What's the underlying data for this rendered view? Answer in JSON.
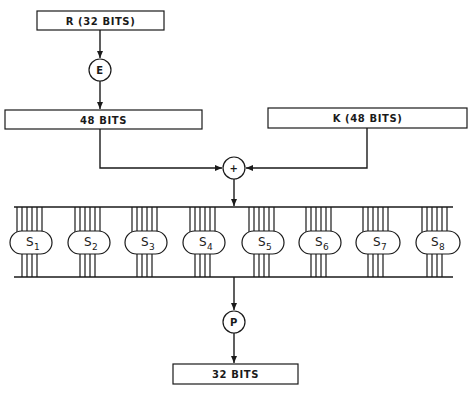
{
  "diagram": {
    "input_box": {
      "label": "R (32 BITS)"
    },
    "expansion": {
      "label": "E"
    },
    "expanded_box": {
      "label": "48 BITS"
    },
    "key_box": {
      "label": "K (48 BITS)"
    },
    "xor": {
      "label": "+"
    },
    "sboxes": [
      {
        "label": "S",
        "sub": "1"
      },
      {
        "label": "S",
        "sub": "2"
      },
      {
        "label": "S",
        "sub": "3"
      },
      {
        "label": "S",
        "sub": "4"
      },
      {
        "label": "S",
        "sub": "5"
      },
      {
        "label": "S",
        "sub": "6"
      },
      {
        "label": "S",
        "sub": "7"
      },
      {
        "label": "S",
        "sub": "8"
      }
    ],
    "sbox_inputs_each": 6,
    "sbox_outputs_each": 4,
    "permutation": {
      "label": "P"
    },
    "output_box": {
      "label": "32 BITS"
    }
  }
}
